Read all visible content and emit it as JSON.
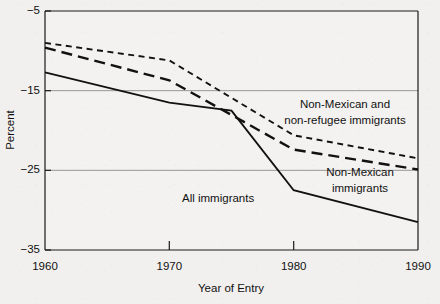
{
  "chart_data": {
    "type": "line",
    "title": "",
    "xlabel": "Year of Entry",
    "ylabel": "Percent",
    "xlim": [
      1960,
      1990
    ],
    "ylim": [
      -35,
      -5
    ],
    "xticks": [
      1960,
      1970,
      1980,
      1990
    ],
    "yticks": [
      -5,
      -15,
      -25,
      -35
    ],
    "xtick_labels": [
      "1960",
      "1970",
      "1980",
      "1990"
    ],
    "ytick_labels": [
      "−5",
      "−15",
      "−25",
      "−35"
    ],
    "grid": "horizontal-gridlines-at--15-and--25",
    "legend": "inline-annotations",
    "series": [
      {
        "name": "All immigrants",
        "style": "solid",
        "x": [
          1960,
          1970,
          1975,
          1980,
          1990
        ],
        "values": [
          -12.7,
          -16.5,
          -17.5,
          -27.5,
          -31.5
        ]
      },
      {
        "name": "Non-Mexican immigrants",
        "style": "long-dash",
        "x": [
          1960,
          1970,
          1980,
          1990
        ],
        "values": [
          -9.6,
          -13.7,
          -22.4,
          -24.9
        ]
      },
      {
        "name": "Non-Mexican and non-refugee immigrants",
        "style": "short-dash",
        "x": [
          1960,
          1970,
          1980,
          1990
        ],
        "values": [
          -9.0,
          -11.2,
          -20.6,
          -23.5
        ]
      }
    ],
    "annotations": [
      {
        "id": "ann-non-mexican-non-refugee",
        "line1": "Non-Mexican and",
        "line2": "non-refugee immigrants",
        "x": 345,
        "y": 104
      },
      {
        "id": "ann-non-mexican",
        "line1": "Non-Mexican",
        "line2": "immigrants",
        "x": 360,
        "y": 172
      },
      {
        "id": "ann-all-immigrants",
        "line1": "All immigrants",
        "line2": "",
        "x": 228,
        "y": 198
      }
    ]
  },
  "axis": {
    "y_title": "Percent",
    "x_title": "Year of Entry"
  }
}
